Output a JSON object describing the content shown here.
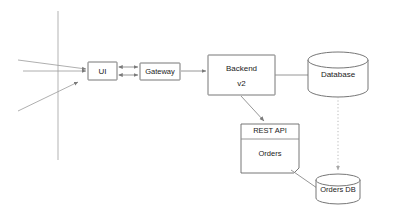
{
  "diagram": {
    "background_color": "#ffffff",
    "stroke_color": "#666666",
    "edge_color": "#8a8a8a",
    "dotted_edge_color": "#b0b0b0",
    "nodes": {
      "ui": {
        "label": "UI",
        "shape": "rectangle"
      },
      "gateway": {
        "label": "Gateway",
        "shape": "rectangle"
      },
      "backend_line1": {
        "label": "Backend"
      },
      "backend_line2": {
        "label": "v2"
      },
      "database": {
        "label": "Database",
        "shape": "cylinder"
      },
      "rest_api_header": {
        "label": "REST API"
      },
      "rest_api_body": {
        "label": "Orders"
      },
      "orders_db": {
        "label": "Orders DB",
        "shape": "cylinder"
      }
    },
    "edges": [
      {
        "from": "external",
        "to": "ui",
        "style": "solid",
        "arrow": "end"
      },
      {
        "from": "external",
        "to": "ui",
        "style": "solid",
        "arrow": "end"
      },
      {
        "from": "external",
        "to": "ui",
        "style": "solid",
        "arrow": "end"
      },
      {
        "from": "ui",
        "to": "gateway",
        "style": "solid",
        "arrow": "both"
      },
      {
        "from": "ui",
        "to": "gateway",
        "style": "solid",
        "arrow": "both"
      },
      {
        "from": "gateway",
        "to": "backend",
        "style": "solid",
        "arrow": "end"
      },
      {
        "from": "backend",
        "to": "database",
        "style": "solid",
        "arrow": "none"
      },
      {
        "from": "backend",
        "to": "rest_api",
        "style": "solid",
        "arrow": "end"
      },
      {
        "from": "database",
        "to": "orders_db",
        "style": "dotted",
        "arrow": "end"
      },
      {
        "from": "rest_api",
        "to": "orders_db",
        "style": "solid",
        "arrow": "none"
      }
    ]
  }
}
